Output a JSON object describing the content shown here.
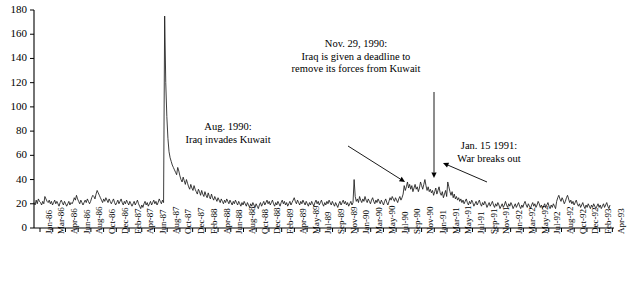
{
  "chart_data": {
    "type": "line",
    "title": "",
    "subtitle": "",
    "xlabel": "",
    "ylabel": "",
    "ylim": [
      0,
      180
    ],
    "xlim": [
      "Jan-86",
      "Apr-93"
    ],
    "grid": false,
    "legend": null,
    "ytick_labels": [
      "0",
      "20",
      "40",
      "60",
      "80",
      "100",
      "120",
      "140",
      "160",
      "180"
    ],
    "ytick_values": [
      0,
      20,
      40,
      60,
      80,
      100,
      120,
      140,
      160,
      180
    ],
    "xtick_labels": [
      "Jan-86",
      "Mar-86",
      "Apr-86",
      "Jun-86",
      "Aug-86",
      "Oct-86",
      "Dec-86",
      "Feb-87",
      "Apr-87",
      "Jun-87",
      "Aug-87",
      "Oct-87",
      "Dec-87",
      "Feb-88",
      "Apr-88",
      "Jun-88",
      "Aug-88",
      "Oct-88",
      "Dec-88",
      "Feb-89",
      "Apr-89",
      "May-89",
      "Jul-89",
      "Sep-89",
      "Nov-89",
      "Jan-90",
      "Mar-90",
      "May-90",
      "Jul-90",
      "Sep-90",
      "Nov-90",
      "Jan-91",
      "Mar-91",
      "May-91",
      "Jul-91",
      "Sep-91",
      "Nov-91",
      "Jan-92",
      "Mar-92",
      "May-92",
      "Jul-92",
      "Aug-92",
      "Oct-92",
      "Dec-92",
      "Feb-93",
      "Apr-93"
    ],
    "series": [
      {
        "name": "Volatility Index",
        "color": "#1a1a1a",
        "x": [
          "Jan-86",
          "Feb-86",
          "Mar-86",
          "Apr-86",
          "May-86",
          "Jun-86",
          "Jul-86",
          "Aug-86",
          "Sep-86",
          "Oct-86",
          "Nov-86",
          "Dec-86",
          "Jan-87",
          "Feb-87",
          "Mar-87",
          "Apr-87",
          "May-87",
          "Jun-87",
          "Jul-87",
          "Aug-87",
          "Sep-87",
          "Oct-87",
          "Nov-87",
          "Dec-87",
          "Jan-88",
          "Feb-88",
          "Mar-88",
          "Apr-88",
          "May-88",
          "Jun-88",
          "Jul-88",
          "Aug-88",
          "Sep-88",
          "Oct-88",
          "Nov-88",
          "Dec-88",
          "Jan-89",
          "Feb-89",
          "Mar-89",
          "Apr-89",
          "May-89",
          "Jun-89",
          "Jul-89",
          "Aug-89",
          "Sep-89",
          "Oct-89",
          "Nov-89",
          "Dec-89",
          "Jan-90",
          "Feb-90",
          "Mar-90",
          "Apr-90",
          "May-90",
          "Jun-90",
          "Jul-90",
          "Aug-90",
          "Sep-90",
          "Oct-90",
          "Nov-90",
          "Dec-90",
          "Jan-91",
          "Feb-91",
          "Mar-91",
          "Apr-91",
          "May-91",
          "Jun-91",
          "Jul-91",
          "Aug-91",
          "Sep-91",
          "Oct-91",
          "Nov-91",
          "Dec-91",
          "Jan-92",
          "Feb-92",
          "Mar-92",
          "Apr-92",
          "May-92",
          "Jun-92",
          "Jul-92",
          "Aug-92",
          "Sep-92",
          "Oct-92",
          "Nov-92",
          "Dec-92",
          "Jan-93",
          "Feb-93",
          "Mar-93",
          "Apr-93"
        ],
        "values_weekly": [
          21,
          19,
          23,
          20,
          24,
          22,
          21,
          19,
          22,
          20,
          26,
          24,
          22,
          21,
          23,
          20,
          22,
          19,
          21,
          23,
          20,
          22,
          20,
          18,
          21,
          23,
          21,
          19,
          22,
          20,
          18,
          20,
          22,
          19,
          21,
          20,
          22,
          25,
          23,
          27,
          24,
          22,
          20,
          23,
          21,
          19,
          21,
          23,
          21,
          24,
          22,
          20,
          22,
          25,
          27,
          26,
          24,
          28,
          31,
          29,
          27,
          25,
          23,
          21,
          24,
          22,
          25,
          23,
          21,
          24,
          22,
          20,
          22,
          24,
          21,
          19,
          21,
          23,
          20,
          22,
          24,
          21,
          19,
          22,
          20,
          23,
          21,
          19,
          22,
          20,
          18,
          20,
          22,
          19,
          21,
          23,
          20,
          18,
          16,
          19,
          17,
          20,
          22,
          19,
          21,
          18,
          20,
          22,
          19,
          21,
          23,
          20,
          22,
          19,
          21,
          24,
          22,
          20,
          23,
          21,
          175,
          120,
          92,
          74,
          63,
          58,
          55,
          52,
          50,
          48,
          46,
          44,
          50,
          47,
          43,
          40,
          38,
          42,
          39,
          36,
          40,
          37,
          34,
          32,
          36,
          33,
          31,
          35,
          32,
          30,
          28,
          32,
          30,
          27,
          31,
          28,
          26,
          30,
          27,
          25,
          29,
          26,
          24,
          28,
          25,
          23,
          26,
          24,
          22,
          25,
          23,
          21,
          24,
          22,
          20,
          23,
          21,
          24,
          22,
          20,
          23,
          21,
          19,
          22,
          20,
          23,
          21,
          19,
          22,
          20,
          18,
          21,
          19,
          22,
          20,
          18,
          21,
          19,
          17,
          20,
          18,
          21,
          19,
          17,
          20,
          18,
          16,
          19,
          21,
          18,
          20,
          22,
          19,
          21,
          23,
          20,
          22,
          19,
          21,
          23,
          20,
          18,
          21,
          19,
          22,
          20,
          18,
          21,
          23,
          20,
          22,
          19,
          21,
          18,
          20,
          22,
          19,
          21,
          23,
          25,
          22,
          20,
          23,
          21,
          19,
          22,
          20,
          23,
          21,
          19,
          22,
          20,
          18,
          21,
          19,
          22,
          20,
          18,
          21,
          23,
          20,
          22,
          19,
          21,
          23,
          20,
          18,
          21,
          19,
          22,
          20,
          23,
          21,
          19,
          22,
          20,
          18,
          21,
          19,
          17,
          20,
          22,
          19,
          21,
          23,
          20,
          22,
          19,
          21,
          18,
          20,
          22,
          19,
          21,
          40,
          26,
          22,
          24,
          21,
          26,
          23,
          21,
          24,
          22,
          26,
          23,
          21,
          24,
          22,
          20,
          23,
          25,
          22,
          20,
          23,
          21,
          24,
          22,
          20,
          23,
          21,
          19,
          22,
          24,
          21,
          19,
          22,
          25,
          23,
          26,
          24,
          22,
          25,
          23,
          21,
          24,
          26,
          23,
          25,
          28,
          35,
          31,
          34,
          38,
          33,
          36,
          32,
          35,
          30,
          33,
          36,
          32,
          34,
          30,
          33,
          38,
          35,
          32,
          36,
          40,
          35,
          31,
          34,
          30,
          32,
          29,
          31,
          27,
          30,
          33,
          28,
          31,
          34,
          29,
          27,
          30,
          25,
          28,
          31,
          26,
          38,
          34,
          30,
          27,
          30,
          25,
          28,
          24,
          26,
          23,
          25,
          22,
          24,
          21,
          23,
          20,
          22,
          24,
          21,
          19,
          22,
          20,
          23,
          21,
          18,
          20,
          22,
          19,
          21,
          23,
          20,
          18,
          21,
          19,
          22,
          20,
          17,
          19,
          21,
          18,
          20,
          22,
          19,
          17,
          20,
          18,
          21,
          19,
          16,
          18,
          20,
          17,
          19,
          22,
          19,
          17,
          20,
          18,
          21,
          19,
          16,
          18,
          20,
          17,
          19,
          21,
          18,
          16,
          19,
          17,
          20,
          22,
          19,
          17,
          20,
          18,
          16,
          19,
          21,
          18,
          20,
          17,
          19,
          22,
          20,
          17,
          19,
          16,
          18,
          20,
          17,
          19,
          21,
          18,
          16,
          19,
          17,
          20,
          18,
          16,
          22,
          25,
          27,
          24,
          22,
          25,
          23,
          20,
          22,
          25,
          27,
          24,
          21,
          23,
          20,
          22,
          19,
          21,
          23,
          20,
          18,
          20,
          17,
          19,
          21,
          18,
          16,
          19,
          17,
          20,
          18,
          16,
          19,
          17,
          20,
          18,
          16,
          18,
          20,
          17,
          19,
          16,
          18,
          20,
          17,
          19,
          21,
          18,
          16,
          19
        ],
        "peak_value": 175,
        "peak_label": "Oct-87"
      }
    ],
    "annotations": [
      {
        "id": "nov-1990",
        "lines": [
          "Nov. 29, 1990:",
          "Iraq is given a deadline to",
          "remove its forces from Kuwait"
        ],
        "text_x": 356,
        "text_y": 38,
        "arrow_from_x": 434,
        "arrow_from_y": 92,
        "arrow_to_x": 434,
        "arrow_to_y": 178
      },
      {
        "id": "aug-1990",
        "lines": [
          "Aug. 1990:",
          "Iraq invades Kuwait"
        ],
        "text_x": 228,
        "text_y": 121,
        "arrow_from_x": 348,
        "arrow_from_y": 146,
        "arrow_to_x": 405,
        "arrow_to_y": 182
      },
      {
        "id": "jan-1991",
        "lines": [
          "Jan. 15 1991:",
          "War breaks out"
        ],
        "text_x": 489,
        "text_y": 140,
        "arrow_from_x": 487,
        "arrow_from_y": 182,
        "arrow_to_x": 443,
        "arrow_to_y": 163
      }
    ],
    "axis": {
      "line_color": "#000000",
      "left_px": 34,
      "right_px": 614,
      "top_px": 10,
      "bottom_px": 228
    }
  }
}
